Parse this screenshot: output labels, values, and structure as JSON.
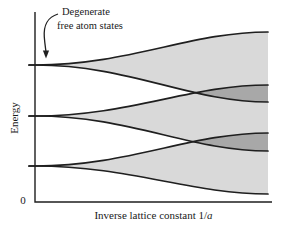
{
  "figure": {
    "annotation": {
      "line1": "Degenerate",
      "line2": "free atom states"
    },
    "y_axis_label": "Energy",
    "x_axis_label_prefix": "Inverse lattice constant 1/",
    "x_axis_label_italic": "a",
    "origin_label": "0"
  },
  "chart_data": {
    "type": "area",
    "xlabel": "Inverse lattice constant 1/a",
    "ylabel": "Energy",
    "x_origin_tick": "0",
    "annotation": "Degenerate free atom states",
    "legend": "none",
    "grid": false,
    "axis_ranges": {
      "x": [
        0,
        1
      ],
      "energy": [
        0,
        1
      ]
    },
    "bands_normalized": [
      {
        "name": "upper band",
        "atomic_level_energy": 0.72,
        "top_edge_at_xmax": 0.89,
        "bottom_edge_at_xmax": 0.53
      },
      {
        "name": "middle band",
        "atomic_level_energy": 0.45,
        "top_edge_at_xmax": 0.62,
        "bottom_edge_at_xmax": 0.27
      },
      {
        "name": "lower band",
        "atomic_level_energy": 0.19,
        "top_edge_at_xmax": 0.36,
        "bottom_edge_at_xmax": 0.04
      }
    ],
    "overlaps_normalized": [
      {
        "between": [
          "upper band",
          "middle band"
        ],
        "starts_at_x": 0.68,
        "shading": "darker"
      },
      {
        "between": [
          "middle band",
          "lower band"
        ],
        "starts_at_x": 0.68,
        "shading": "darker"
      }
    ],
    "colors": {
      "band_fill": "#d9d9d9",
      "overlap_fill": "#a8a8a8",
      "line": "#1f1f1f",
      "background": "#ffffff"
    },
    "pixel_geometry": {
      "w": 285,
      "h": 234,
      "x0": 35,
      "cx1": 130,
      "cx2": 190,
      "x1": 268,
      "tick_len": 6,
      "bands": [
        {
          "level": 65,
          "top": 32,
          "bottom": 102
        },
        {
          "level": 116,
          "top": 85,
          "bottom": 151
        },
        {
          "level": 166,
          "top": 133,
          "bottom": 194
        }
      ],
      "axis": {
        "x": 35,
        "y_top": 12,
        "y_bottom": 202,
        "x_right": 272
      }
    },
    "arrow": {
      "path": "M58,14 C47,17.5 43.5,25 44.3,37 C44.8,44 45.6,48.5 46,52",
      "head": "42.9,50.5 49.1,50.5 46,58.5"
    }
  }
}
